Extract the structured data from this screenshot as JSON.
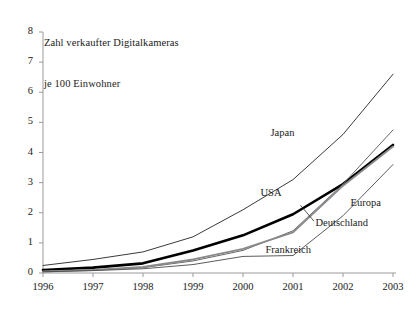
{
  "chart_data": {
    "type": "line",
    "title": "Zahl verkaufter Digitalkameras je 100 Einwohner",
    "title_lines": [
      "Zahl verkaufter Digitalkameras",
      "je 100 Einwohner"
    ],
    "xlabel": "",
    "ylabel": "",
    "categories": [
      "1996",
      "1997",
      "1998",
      "1999",
      "2000",
      "2001",
      "2002",
      "2003"
    ],
    "x": [
      1996,
      1997,
      1998,
      1999,
      2000,
      2001,
      2002,
      2003
    ],
    "xlim": [
      1996,
      2003
    ],
    "ylim": [
      0,
      8
    ],
    "yticks": [
      0,
      1,
      2,
      3,
      4,
      5,
      6,
      7,
      8
    ],
    "ytick_labels": [
      "0",
      "1",
      "2",
      "3",
      "4",
      "5",
      "6",
      "7",
      "8"
    ],
    "xtick_labels": [
      "1996",
      "1997",
      "1998",
      "1999",
      "2000",
      "2001",
      "2002",
      "2003"
    ],
    "grid": false,
    "legend": "inline-annotations",
    "series": [
      {
        "name": "Japan",
        "values": [
          0.25,
          0.45,
          0.7,
          1.2,
          2.1,
          3.1,
          4.6,
          6.6
        ],
        "color": "#3a3a3a",
        "width": 1.0,
        "label_x": 2000.55,
        "label_y": 4.62
      },
      {
        "name": "USA",
        "values": [
          0.1,
          0.18,
          0.32,
          0.75,
          1.25,
          1.95,
          2.95,
          4.25
        ],
        "color": "#000000",
        "width": 2.6,
        "label_x": 2000.35,
        "label_y": 2.62
      },
      {
        "name": "Europa",
        "values": [
          0.05,
          0.1,
          0.18,
          0.4,
          0.75,
          1.4,
          2.95,
          4.75
        ],
        "color": "#565656",
        "width": 0.9,
        "label_x": 2002.15,
        "label_y": 2.28
      },
      {
        "name": "Deutschland",
        "values": [
          0.05,
          0.1,
          0.2,
          0.45,
          0.8,
          1.35,
          2.9,
          4.2
        ],
        "color": "#8a8a8a",
        "width": 1.9,
        "label_x": 2001.45,
        "label_y": 1.62
      },
      {
        "name": "Frankreich",
        "values": [
          0.04,
          0.08,
          0.14,
          0.28,
          0.55,
          0.58,
          1.9,
          3.6
        ],
        "color": "#4a4a4a",
        "width": 0.9,
        "label_x": 2000.45,
        "label_y": 0.72
      }
    ]
  },
  "axes": {
    "y_axis_name": "value-axis",
    "x_axis_name": "year-axis"
  }
}
